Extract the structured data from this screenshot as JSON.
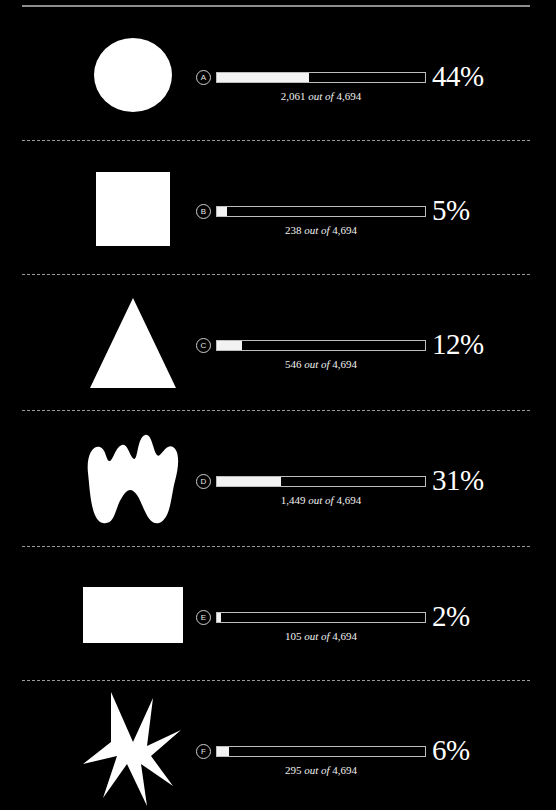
{
  "meta": {
    "background_color": "#000000",
    "foreground_color": "#ffffff",
    "rule_color": "#8d8d8d",
    "bar_border_color": "#bdbdbd",
    "bar_fill_color": "#f2f2f2",
    "total": "4,694",
    "connector_text": "out of"
  },
  "chart_data": {
    "type": "bar",
    "title": "",
    "xlabel": "",
    "ylabel": "",
    "xlim": [
      0,
      100
    ],
    "grid": false,
    "legend": "none",
    "total_reference": 4694,
    "categories": [
      "A",
      "B",
      "C",
      "D",
      "E",
      "F"
    ],
    "values": [
      44,
      5,
      12,
      31,
      2,
      6
    ],
    "counts": [
      2061,
      238,
      546,
      1449,
      105,
      295
    ]
  },
  "rows": [
    {
      "badge": "A",
      "shape": "circle-shape",
      "percent_label": "44%",
      "percent_value": 44,
      "count_label": "2,061",
      "connector": "out of",
      "total_label": "4,694",
      "caption_full": "2,061 out of 4,694"
    },
    {
      "badge": "B",
      "shape": "square-shape",
      "percent_label": "5%",
      "percent_value": 5,
      "count_label": "238",
      "connector": "out of",
      "total_label": "4,694",
      "caption_full": "238 out of 4,694"
    },
    {
      "badge": "C",
      "shape": "triangle-shape",
      "percent_label": "12%",
      "percent_value": 12,
      "count_label": "546",
      "connector": "out of",
      "total_label": "4,694",
      "caption_full": "546 out of 4,694"
    },
    {
      "badge": "D",
      "shape": "blob-shape",
      "percent_label": "31%",
      "percent_value": 31,
      "count_label": "1,449",
      "connector": "out of",
      "total_label": "4,694",
      "caption_full": "1,449 out of 4,694"
    },
    {
      "badge": "E",
      "shape": "rectangle-shape",
      "percent_label": "2%",
      "percent_value": 2,
      "count_label": "105",
      "connector": "out of",
      "total_label": "4,694",
      "caption_full": "105 out of 4,694"
    },
    {
      "badge": "F",
      "shape": "star-burst-shape",
      "percent_label": "6%",
      "percent_value": 6,
      "count_label": "295",
      "connector": "out of",
      "total_label": "4,694",
      "caption_full": "295 out of 4,694"
    }
  ]
}
